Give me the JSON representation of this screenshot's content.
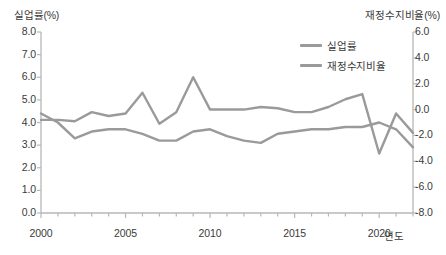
{
  "chart_data": {
    "type": "line",
    "title": "",
    "xlabel": "연도",
    "ylabel_left": "실업률(%)",
    "ylabel_right": "재정수지비율(%)",
    "grid": false,
    "legend_position": "top-right",
    "x": [
      2000,
      2001,
      2002,
      2003,
      2004,
      2005,
      2006,
      2007,
      2008,
      2009,
      2010,
      2011,
      2012,
      2013,
      2014,
      2015,
      2016,
      2017,
      2018,
      2019,
      2020,
      2021,
      2022
    ],
    "xticks": [
      2000,
      2005,
      2010,
      2015,
      2020
    ],
    "xtick_labels": [
      "2000",
      "2005",
      "2010",
      "2015",
      "2020"
    ],
    "xlim": [
      2000,
      2022
    ],
    "ylim_left": [
      0.0,
      8.0
    ],
    "yticks_left": [
      0.0,
      1.0,
      2.0,
      3.0,
      4.0,
      5.0,
      6.0,
      7.0,
      8.0
    ],
    "ytick_labels_left": [
      "0.0",
      "1.0",
      "2.0",
      "3.0",
      "4.0",
      "5.0",
      "6.0",
      "7.0",
      "8.0"
    ],
    "ylim_right": [
      6.0,
      -8.0
    ],
    "yticks_right": [
      -8.0,
      -6.0,
      -4.0,
      -2.0,
      0.0,
      2.0,
      4.0,
      6.0
    ],
    "ytick_labels_right": [
      "-8.0",
      "-6.0",
      "-4.0",
      "-2.0",
      "0.0",
      "2.0",
      "4.0",
      "6.0"
    ],
    "series": [
      {
        "name": "실업률",
        "axis": "left",
        "color": "#9a9a9a",
        "values": [
          4.4,
          4.0,
          3.3,
          3.6,
          3.7,
          3.7,
          3.5,
          3.2,
          3.2,
          3.6,
          3.7,
          3.4,
          3.2,
          3.1,
          3.5,
          3.6,
          3.7,
          3.7,
          3.8,
          3.8,
          4.0,
          3.7,
          2.9
        ]
      },
      {
        "name": "재정수지비율",
        "axis": "right",
        "color": "#9a9a9a",
        "values": [
          -0.8,
          -0.8,
          -0.9,
          -0.2,
          -0.5,
          -0.3,
          1.3,
          -1.1,
          -0.2,
          2.5,
          0.0,
          0.0,
          0.0,
          0.2,
          0.1,
          -0.2,
          -0.2,
          0.2,
          0.8,
          1.2,
          -3.4,
          -0.3,
          -1.8
        ]
      }
    ],
    "legend": [
      "실업률",
      "재정수지비율"
    ],
    "annotations": []
  },
  "plot_geometry": {
    "left_px": 41,
    "right_px": 413,
    "top_px": 32,
    "bottom_px": 213,
    "axis_color": "#b7b7b7",
    "line_color": "#9a9a9a",
    "line_width": 2.4
  }
}
